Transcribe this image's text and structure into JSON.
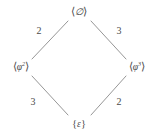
{
  "figure": {
    "kind": "hasse-diagram",
    "shape": "diamond",
    "background_color": "#ffffff",
    "line_color": "#8a8a8a",
    "text_color": "#4a4a4a"
  },
  "nodes": [
    {
      "id": "top",
      "label": "⟨∅⟩",
      "open_bracket": "⟨",
      "symbol": "∅",
      "superscript": "",
      "close_bracket": "⟩",
      "x": 79,
      "y": 12
    },
    {
      "id": "left",
      "label": "⟨φ²⟩",
      "open_bracket": "⟨",
      "symbol": "φ",
      "superscript": "2",
      "close_bracket": "⟩",
      "x": 21,
      "y": 67
    },
    {
      "id": "right",
      "label": "⟨φ³⟩",
      "open_bracket": "⟨",
      "symbol": "φ",
      "superscript": "3",
      "close_bracket": "⟩",
      "x": 137,
      "y": 67
    },
    {
      "id": "bottom",
      "label": "{ε}",
      "open_bracket": "{",
      "symbol": "ε",
      "superscript": "",
      "close_bracket": "}",
      "x": 79,
      "y": 124
    }
  ],
  "edges": [
    {
      "id": "top-left",
      "from": "left",
      "to": "top",
      "label": "2",
      "x1": 32,
      "y1": 59,
      "x2": 68,
      "y2": 21,
      "label_x": 39,
      "label_y": 31
    },
    {
      "id": "top-right",
      "from": "top",
      "to": "right",
      "label": "3",
      "x1": 91,
      "y1": 21,
      "x2": 126,
      "y2": 59,
      "label_x": 119,
      "label_y": 31
    },
    {
      "id": "bottom-left",
      "from": "bottom",
      "to": "left",
      "label": "3",
      "x1": 32,
      "y1": 76,
      "x2": 68,
      "y2": 115,
      "label_x": 33,
      "label_y": 102
    },
    {
      "id": "bottom-right",
      "from": "right",
      "to": "bottom",
      "label": "2",
      "x1": 126,
      "y1": 76,
      "x2": 91,
      "y2": 115,
      "label_x": 119,
      "label_y": 102
    }
  ]
}
